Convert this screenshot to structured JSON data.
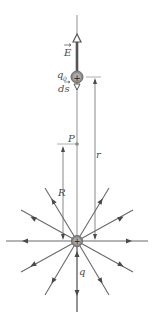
{
  "diagram": {
    "labels": {
      "field_vector": "E",
      "test_charge": "q",
      "test_charge_sub": "0",
      "displacement": "ds",
      "point": "P",
      "radius_R": "R",
      "radius_r": "r",
      "source_charge": "q"
    },
    "charge_sign": "+",
    "colors": {
      "field_line": "#6a6a6a",
      "axis": "#b8b8b8",
      "charge_fill": "#8a8a8a",
      "E_arrow": "#555555"
    },
    "field_line_count": 12
  }
}
